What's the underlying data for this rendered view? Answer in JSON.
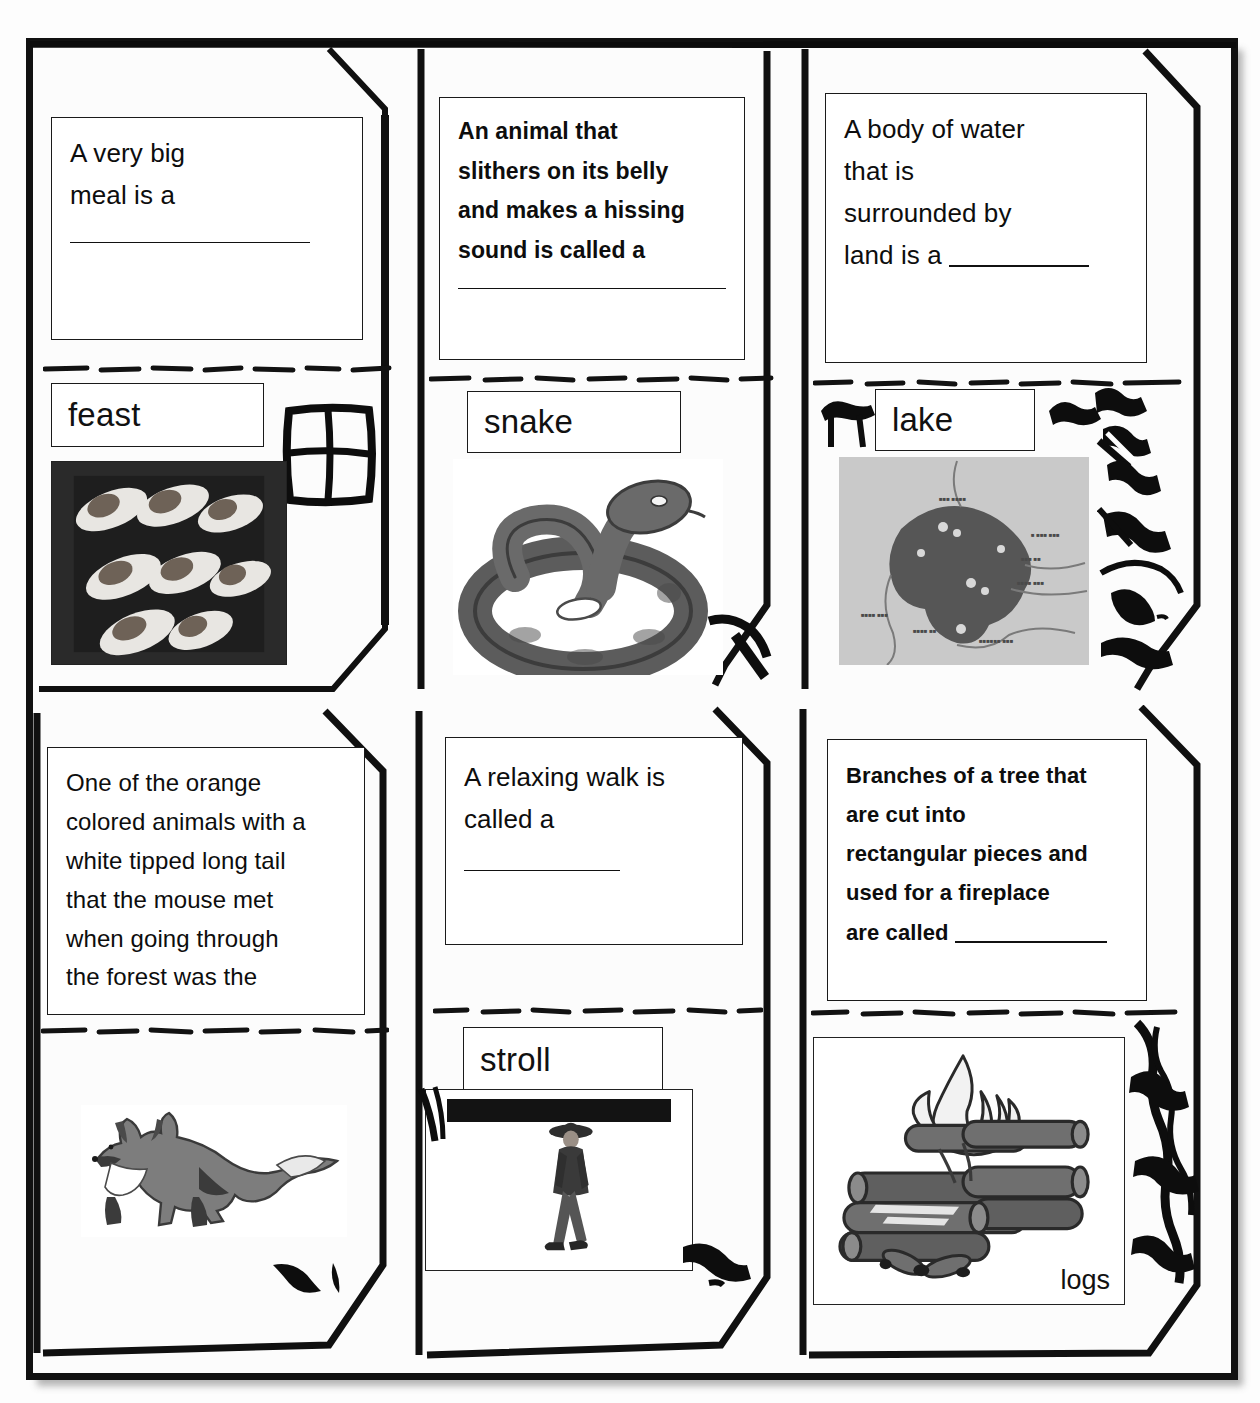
{
  "document": {
    "type": "vocabulary-foldable-worksheet",
    "orientation": "portrait",
    "columns": 3,
    "rows": 2
  },
  "cells": [
    {
      "id": "feast",
      "question_lines": [
        "A very big",
        "meal is a"
      ],
      "question_bold": false,
      "blank_style": "own-line",
      "answer": "feast",
      "picture": {
        "name": "appetizer-spoons-photo",
        "caption": "",
        "kind": "photo"
      },
      "doodle": "window-sketch"
    },
    {
      "id": "snake",
      "question_lines": [
        "An animal that",
        "slithers on its belly",
        "and makes a hissing",
        "sound is called a"
      ],
      "question_bold": true,
      "blank_style": "own-line",
      "answer": "snake",
      "picture": {
        "name": "coiled-snake-illustration",
        "caption": "",
        "kind": "clipart"
      },
      "doodle": "corner-scribble"
    },
    {
      "id": "lake",
      "question_lines": [
        "A body of water",
        "that is",
        "surrounded by",
        "land is a"
      ],
      "question_bold": false,
      "blank_style": "inline-last-line",
      "answer": "lake",
      "picture": {
        "name": "lake-map-image",
        "caption": "",
        "kind": "map"
      },
      "doodle": "figure-scribbles"
    },
    {
      "id": "fox",
      "question_lines": [
        "One of the orange",
        "colored animals with a",
        "white tipped long tail",
        "that the mouse met",
        "when going through",
        "the forest was the"
      ],
      "question_bold": false,
      "blank_style": "none",
      "answer": "",
      "picture": {
        "name": "walking-fox-illustration",
        "caption": "",
        "kind": "clipart"
      },
      "doodle": "small-marks"
    },
    {
      "id": "stroll",
      "question_lines": [
        "A relaxing walk is",
        "called a"
      ],
      "question_bold": false,
      "blank_style": "own-line",
      "answer": "stroll",
      "picture": {
        "name": "man-walking-photo",
        "caption": "",
        "kind": "photo"
      },
      "doodle": "corner-scribble"
    },
    {
      "id": "logs",
      "question_lines": [
        "Branches of a tree that",
        "are cut into",
        "rectangular pieces and",
        "used for a fireplace",
        "are called"
      ],
      "question_bold": true,
      "blank_style": "inline-last-line",
      "answer": "",
      "picture": {
        "name": "campfire-logs-illustration",
        "caption": "logs",
        "kind": "clipart"
      },
      "doodle": "tree-scribble"
    }
  ],
  "colors": {
    "ink": "#111111",
    "paper": "#fdfdfd",
    "illustration_gray": "#7d7d7d",
    "illustration_dark": "#4a4a4a",
    "map_background": "#c9c9c9",
    "map_water": "#555555"
  }
}
